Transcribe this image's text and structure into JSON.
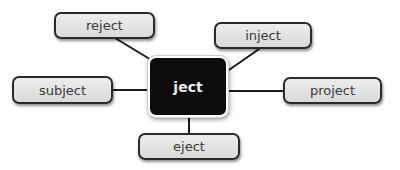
{
  "diagram": {
    "type": "word-web",
    "center": {
      "label": "ject"
    },
    "nodes": [
      {
        "id": "reject",
        "label": "reject"
      },
      {
        "id": "inject",
        "label": "inject"
      },
      {
        "id": "subject",
        "label": "subject"
      },
      {
        "id": "project",
        "label": "project"
      },
      {
        "id": "eject",
        "label": "eject"
      }
    ],
    "colors": {
      "center_fill": "#0c0c0c",
      "center_text": "#eaeaea",
      "node_fill": "#e3e3e3",
      "node_border": "#2a2a2a",
      "connector": "#1a1a1a"
    }
  }
}
